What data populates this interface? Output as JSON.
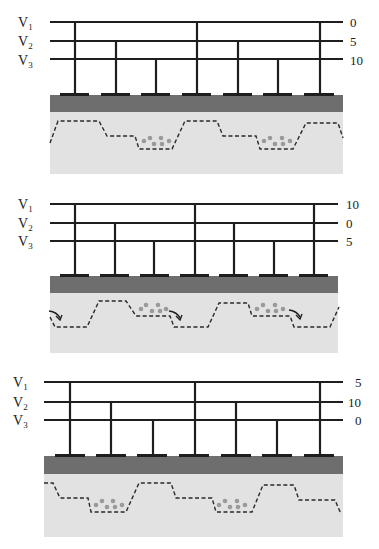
{
  "figure": {
    "colors": {
      "wire": "#1e1e1e",
      "oxide": "#6e6e6e",
      "substrate": "#e2e2e2",
      "potential_line": "#2a2a2a",
      "charge": "#9a9a9a"
    },
    "labels": [
      "V",
      "V",
      "V"
    ],
    "subscripts": [
      "1",
      "2",
      "3"
    ],
    "panels": [
      {
        "id": "panel-1",
        "voltages": [
          "0",
          "5",
          "10"
        ]
      },
      {
        "id": "panel-2",
        "voltages": [
          "10",
          "0",
          "5"
        ]
      },
      {
        "id": "panel-3",
        "voltages": [
          "5",
          "10",
          "0"
        ]
      }
    ]
  }
}
